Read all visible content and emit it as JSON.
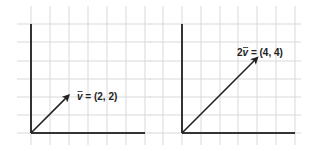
{
  "panels": [
    {
      "id": "left",
      "label_prefix": "",
      "label_symbol": "v",
      "label_value": " = (2, 2)",
      "vector": [
        2,
        2
      ],
      "origin_px": [
        31,
        133
      ],
      "grid_x_px": [
        31,
        50,
        69,
        88,
        107,
        126,
        145
      ],
      "grid_y_px": [
        24,
        42,
        61,
        79,
        97,
        115,
        133
      ],
      "axis_x_end_px": 145,
      "axis_y_top_px": 24,
      "label_pos_px": [
        77,
        100
      ]
    },
    {
      "id": "right",
      "label_prefix": "2",
      "label_symbol": "v",
      "label_value": " = (4, 4)",
      "vector": [
        4,
        4
      ],
      "origin_px": [
        182,
        133
      ],
      "grid_x_px": [
        163,
        182,
        201,
        220,
        238,
        257,
        276,
        295
      ],
      "grid_y_px": [
        24,
        42,
        61,
        79,
        97,
        115,
        133
      ],
      "axis_x_end_px": 295,
      "axis_y_top_px": 24,
      "label_pos_px": [
        237,
        56
      ]
    }
  ],
  "unit_px": 18.8,
  "colors": {
    "grid": "#d9d9d9",
    "axis": "#333333",
    "vector": "#222222",
    "text": "#222222"
  }
}
